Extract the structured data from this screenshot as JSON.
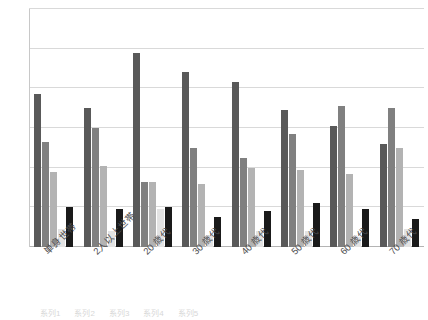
{
  "chart_data": {
    "type": "bar",
    "title": "",
    "subtitle": "",
    "xlabel": "",
    "ylabel": "",
    "ylim": [
      0,
      60
    ],
    "yticks": [
      0,
      10,
      20,
      30,
      40,
      50,
      60
    ],
    "grid": true,
    "legend_position": "bottom",
    "categories": [
      "単身世帯",
      "2人以上世帯",
      "20 歳代",
      "30 歳代",
      "40 歳代",
      "50 歳代",
      "60 歳代",
      "70 歳代"
    ],
    "series": [
      {
        "name": "系列1",
        "color": "#595959",
        "values": [
          38.5,
          35.0,
          49.0,
          44.0,
          41.5,
          34.5,
          30.5,
          26.0
        ]
      },
      {
        "name": "系列2",
        "color": "#808080",
        "values": [
          26.5,
          30.0,
          16.5,
          25.0,
          22.5,
          28.5,
          35.5,
          35.0
        ]
      },
      {
        "name": "系列3",
        "color": "#b3b3b3",
        "values": [
          19.0,
          20.5,
          16.5,
          16.0,
          20.0,
          19.5,
          18.5,
          25.0
        ]
      },
      {
        "name": "系列4",
        "color": "#e3e3e3",
        "values": [
          4.5,
          4.0,
          9.5,
          3.0,
          4.0,
          4.0,
          2.5,
          4.5
        ]
      },
      {
        "name": "系列5",
        "color": "#1a1a1a",
        "values": [
          10.0,
          9.5,
          10.0,
          7.5,
          9.0,
          11.0,
          9.5,
          7.0
        ]
      }
    ]
  },
  "legend_strip": {
    "visible_fragment": "凡例"
  }
}
